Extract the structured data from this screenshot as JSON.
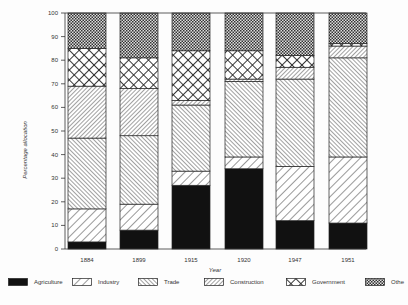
{
  "chart_data": {
    "type": "bar",
    "stacked": true,
    "title": "",
    "xlabel": "Year",
    "ylabel": "Percentage allocation",
    "ylim": [
      0,
      100
    ],
    "yticks": [
      0,
      10,
      20,
      30,
      40,
      50,
      60,
      70,
      80,
      90,
      100
    ],
    "categories": [
      "1884",
      "1899",
      "1915",
      "1920",
      "1947",
      "1951"
    ],
    "series": [
      {
        "name": "Agriculture",
        "pattern": "solid-black",
        "values": [
          3,
          8,
          27,
          34,
          12,
          11
        ]
      },
      {
        "name": "Industry",
        "pattern": "wide-backslash-hatch",
        "values": [
          14,
          11,
          6,
          5,
          23,
          28
        ]
      },
      {
        "name": "Trade",
        "pattern": "dense-slash-hatch",
        "values": [
          30,
          29,
          28,
          32,
          37,
          42
        ]
      },
      {
        "name": "Construction",
        "pattern": "dense-backslash-hatch",
        "values": [
          22,
          20,
          2,
          1,
          5,
          5
        ]
      },
      {
        "name": "Government",
        "pattern": "diamond-crosshatch",
        "values": [
          16,
          13,
          21,
          12,
          5,
          1
        ]
      },
      {
        "name": "Other",
        "pattern": "checkerboard",
        "values": [
          15,
          19,
          16,
          16,
          18,
          13
        ]
      }
    ],
    "legend": {
      "placement": "bottom",
      "labels": [
        "Agriculture",
        "Industry",
        "Trade",
        "Construction",
        "Government",
        "Othe"
      ]
    },
    "grid": false
  }
}
